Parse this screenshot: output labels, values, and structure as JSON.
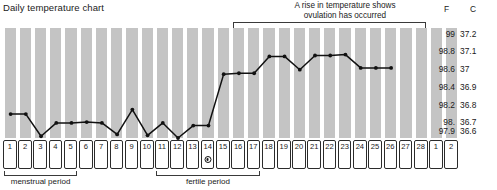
{
  "title": "Daily temperature chart",
  "annotation": {
    "line1": "A rise in temperature shows",
    "line2": "ovulation has occurred"
  },
  "scale": {
    "header_f": "F",
    "header_c": "C",
    "rows": [
      {
        "f": "99",
        "c": "37.2"
      },
      {
        "f": "98.8",
        "c": "37.1"
      },
      {
        "f": "98.6",
        "c": "37"
      },
      {
        "f": "98.4",
        "c": "36.9"
      },
      {
        "f": "98.2",
        "c": "36.8"
      },
      {
        "f": "98.",
        "c": "36.7"
      },
      {
        "f": "97.9",
        "c": "36.6"
      }
    ]
  },
  "periods": [
    {
      "name": "menstrual-period",
      "label": "menstrual period",
      "start_day": 1,
      "end_day": 5
    },
    {
      "name": "fertile-period",
      "label": "fertile period",
      "start_day": 11,
      "end_day": 17
    }
  ],
  "days": [
    {
      "label": "1"
    },
    {
      "label": "2"
    },
    {
      "label": "3"
    },
    {
      "label": "4"
    },
    {
      "label": "5"
    },
    {
      "label": "6"
    },
    {
      "label": "7"
    },
    {
      "label": "8"
    },
    {
      "label": "9"
    },
    {
      "label": "10"
    },
    {
      "label": "11"
    },
    {
      "label": "12"
    },
    {
      "label": "13"
    },
    {
      "label": "14",
      "marker": "ovulation"
    },
    {
      "label": "15"
    },
    {
      "label": "16"
    },
    {
      "label": "17"
    },
    {
      "label": "18"
    },
    {
      "label": "19"
    },
    {
      "label": "20"
    },
    {
      "label": "21"
    },
    {
      "label": "22"
    },
    {
      "label": "23"
    },
    {
      "label": "24"
    },
    {
      "label": "25"
    },
    {
      "label": "26"
    },
    {
      "label": "27"
    },
    {
      "label": "28"
    },
    {
      "label": "1"
    },
    {
      "label": "2"
    }
  ],
  "colors": {
    "band": "#c4c4c4",
    "line": "#111111",
    "cell_border": "#2b2b2b",
    "bracket": "#3a3a3a"
  },
  "chart_data": {
    "type": "line",
    "title": "Daily temperature chart",
    "xlabel": "",
    "ylabel": "",
    "grid": false,
    "legend": "none",
    "x": [
      1,
      2,
      3,
      4,
      5,
      6,
      7,
      8,
      9,
      10,
      11,
      12,
      13,
      14,
      15,
      16,
      17,
      18,
      19,
      20,
      21,
      22,
      23,
      24,
      25,
      26
    ],
    "tick_labels_f": [
      "99",
      "98.8",
      "98.6",
      "98.4",
      "98.2",
      "98.",
      "97.9"
    ],
    "tick_labels_c": [
      "37.2",
      "37.1",
      "37",
      "36.9",
      "36.8",
      "36.7",
      "36.6"
    ],
    "ylim_f": [
      97.83,
      99.07
    ],
    "unit": "degrees Fahrenheit",
    "series": [
      {
        "name": "Basal body temperature",
        "values": [
          98.1,
          98.1,
          97.85,
          98.0,
          98.0,
          98.01,
          98.0,
          97.87,
          98.15,
          97.86,
          98.0,
          97.83,
          97.97,
          97.97,
          98.55,
          98.56,
          98.56,
          98.75,
          98.75,
          98.6,
          98.76,
          98.76,
          98.77,
          98.62,
          98.62,
          98.62
        ]
      }
    ],
    "annotations": [
      {
        "text": "A rise in temperature shows ovulation has occurred",
        "span_days": [
          16,
          27
        ]
      },
      {
        "text": "menstrual period",
        "span_days": [
          1,
          5
        ]
      },
      {
        "text": "fertile period",
        "span_days": [
          11,
          17
        ]
      },
      {
        "text": "ovulation marker",
        "day": 14
      }
    ]
  }
}
